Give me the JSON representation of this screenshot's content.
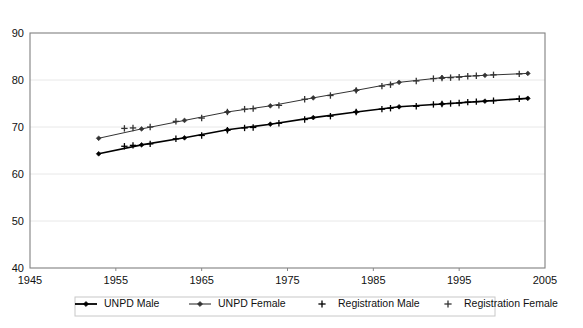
{
  "chart_data": {
    "type": "line",
    "title": "",
    "subtitle": "",
    "xlabel": "",
    "ylabel": "",
    "xlim": [
      1945,
      2005
    ],
    "ylim": [
      40,
      90
    ],
    "x_ticks": [
      1945,
      1955,
      1965,
      1975,
      1985,
      1995,
      2005
    ],
    "y_ticks": [
      40,
      50,
      60,
      70,
      80,
      90
    ],
    "grid": "horizontal",
    "legend_position": "bottom",
    "series": [
      {
        "name": "UNPD Male",
        "marker": "diamond",
        "color": "#000000",
        "line_width": 1.6,
        "points": [
          {
            "x": 1953,
            "y": 64.3
          },
          {
            "x": 1958,
            "y": 66.2
          },
          {
            "x": 1963,
            "y": 67.7
          },
          {
            "x": 1968,
            "y": 69.4
          },
          {
            "x": 1973,
            "y": 70.6
          },
          {
            "x": 1978,
            "y": 72.0
          },
          {
            "x": 1983,
            "y": 73.2
          },
          {
            "x": 1988,
            "y": 74.3
          },
          {
            "x": 1993,
            "y": 74.9
          },
          {
            "x": 1998,
            "y": 75.5
          },
          {
            "x": 2003,
            "y": 76.1
          }
        ]
      },
      {
        "name": "UNPD Female",
        "marker": "diamond",
        "color": "#333333",
        "line_width": 1.0,
        "points": [
          {
            "x": 1953,
            "y": 67.6
          },
          {
            "x": 1958,
            "y": 69.6
          },
          {
            "x": 1963,
            "y": 71.4
          },
          {
            "x": 1968,
            "y": 73.2
          },
          {
            "x": 1973,
            "y": 74.5
          },
          {
            "x": 1978,
            "y": 76.2
          },
          {
            "x": 1983,
            "y": 77.8
          },
          {
            "x": 1988,
            "y": 79.5
          },
          {
            "x": 1993,
            "y": 80.5
          },
          {
            "x": 1998,
            "y": 81.0
          },
          {
            "x": 2003,
            "y": 81.4
          }
        ]
      },
      {
        "name": "Registration Male",
        "marker": "cross",
        "color": "#000000",
        "line_width": 0,
        "points": [
          {
            "x": 1956,
            "y": 65.9
          },
          {
            "x": 1957,
            "y": 66.1
          },
          {
            "x": 1959,
            "y": 66.4
          },
          {
            "x": 1962,
            "y": 67.5
          },
          {
            "x": 1965,
            "y": 68.2
          },
          {
            "x": 1968,
            "y": 69.3
          },
          {
            "x": 1970,
            "y": 69.8
          },
          {
            "x": 1971,
            "y": 69.9
          },
          {
            "x": 1974,
            "y": 70.8
          },
          {
            "x": 1977,
            "y": 71.6
          },
          {
            "x": 1980,
            "y": 72.3
          },
          {
            "x": 1983,
            "y": 73.2
          },
          {
            "x": 1986,
            "y": 73.8
          },
          {
            "x": 1987,
            "y": 74.0
          },
          {
            "x": 1990,
            "y": 74.4
          },
          {
            "x": 1992,
            "y": 74.8
          },
          {
            "x": 1993,
            "y": 74.9
          },
          {
            "x": 1994,
            "y": 75.0
          },
          {
            "x": 1995,
            "y": 75.1
          },
          {
            "x": 1996,
            "y": 75.3
          },
          {
            "x": 1997,
            "y": 75.4
          },
          {
            "x": 1999,
            "y": 75.6
          },
          {
            "x": 2002,
            "y": 76.0
          }
        ]
      },
      {
        "name": "Registration Female",
        "marker": "cross",
        "color": "#333333",
        "line_width": 0,
        "points": [
          {
            "x": 1956,
            "y": 69.7
          },
          {
            "x": 1957,
            "y": 69.8
          },
          {
            "x": 1959,
            "y": 70.0
          },
          {
            "x": 1962,
            "y": 71.2
          },
          {
            "x": 1965,
            "y": 71.9
          },
          {
            "x": 1968,
            "y": 73.2
          },
          {
            "x": 1970,
            "y": 73.8
          },
          {
            "x": 1971,
            "y": 73.9
          },
          {
            "x": 1974,
            "y": 74.6
          },
          {
            "x": 1977,
            "y": 75.9
          },
          {
            "x": 1980,
            "y": 76.7
          },
          {
            "x": 1983,
            "y": 77.8
          },
          {
            "x": 1986,
            "y": 78.7
          },
          {
            "x": 1987,
            "y": 79.0
          },
          {
            "x": 1990,
            "y": 79.8
          },
          {
            "x": 1992,
            "y": 80.3
          },
          {
            "x": 1993,
            "y": 80.4
          },
          {
            "x": 1994,
            "y": 80.5
          },
          {
            "x": 1995,
            "y": 80.6
          },
          {
            "x": 1996,
            "y": 80.8
          },
          {
            "x": 1997,
            "y": 80.9
          },
          {
            "x": 1999,
            "y": 81.1
          },
          {
            "x": 2002,
            "y": 81.3
          }
        ]
      }
    ]
  },
  "axes": {
    "y_tick_labels": [
      "90",
      "80",
      "70",
      "60",
      "50",
      "40"
    ],
    "x_tick_labels": [
      "1945",
      "1955",
      "1965",
      "1975",
      "1985",
      "1995",
      "2005"
    ]
  },
  "legend": {
    "items": [
      {
        "label": "UNPD Male",
        "marker": "line-diamond-thick"
      },
      {
        "label": "UNPD Female",
        "marker": "line-diamond-thin"
      },
      {
        "label": "Registration Male",
        "marker": "cross"
      },
      {
        "label": "Registration Female",
        "marker": "cross"
      }
    ]
  },
  "colors": {
    "plot_border": "#808080",
    "gridline": "#e8e8e8",
    "series_male": "#000000",
    "series_female": "#333333",
    "text": "#111111",
    "legend_border": "#c8c8c8",
    "background": "#ffffff"
  }
}
